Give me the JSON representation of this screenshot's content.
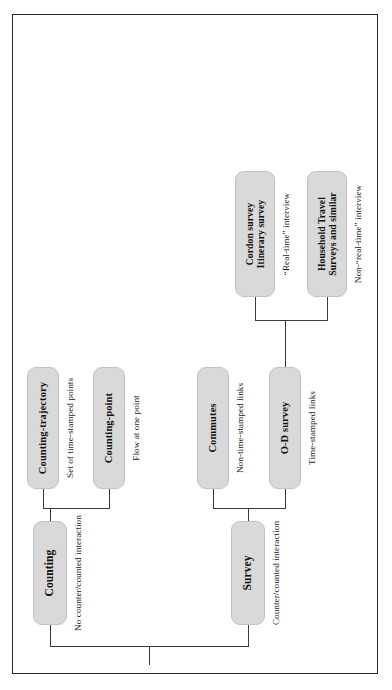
{
  "figure": {
    "type": "hierarchy-tree",
    "orientation": "rotated-90-ccw",
    "border_color": "#2b2b2b",
    "node_fill": "#d9d9d9",
    "node_border": "#c2c2c2",
    "connector_color": "#3a3a3a",
    "background": "#ffffff"
  },
  "nodes": {
    "counting": {
      "label": "Counting",
      "annotation": "No counter/counted interaction"
    },
    "survey": {
      "label": "Survey",
      "annotation": "Counter/counted interaction"
    },
    "counting_trajectory": {
      "label": "Counting-trajectory",
      "annotation": "Set of time-stamped points"
    },
    "counting_point": {
      "label": "Counting-point",
      "annotation": "Flow at one point"
    },
    "commutes": {
      "label": "Commutes",
      "annotation": "Non-time-stamped links"
    },
    "od_survey": {
      "label": "O-D survey",
      "annotation": "Time-stamped links"
    },
    "cordon_survey": {
      "label": "Cordon survey\nItinerary survey",
      "line1": "Cordon survey",
      "line2": "Itinerary survey",
      "annotation": "“Real-time” interview"
    },
    "household_travel": {
      "label": "Household Travel Surveys and similar",
      "line1": "Household Travel",
      "line2": "Surveys and similar",
      "annotation": "Non-“real-time” interview"
    }
  },
  "edges": [
    {
      "from": "root",
      "to": "counting"
    },
    {
      "from": "root",
      "to": "survey"
    },
    {
      "from": "counting",
      "to": "counting_trajectory"
    },
    {
      "from": "counting",
      "to": "counting_point"
    },
    {
      "from": "survey",
      "to": "commutes"
    },
    {
      "from": "survey",
      "to": "od_survey"
    },
    {
      "from": "od_survey",
      "to": "cordon_survey"
    },
    {
      "from": "od_survey",
      "to": "household_travel"
    }
  ]
}
